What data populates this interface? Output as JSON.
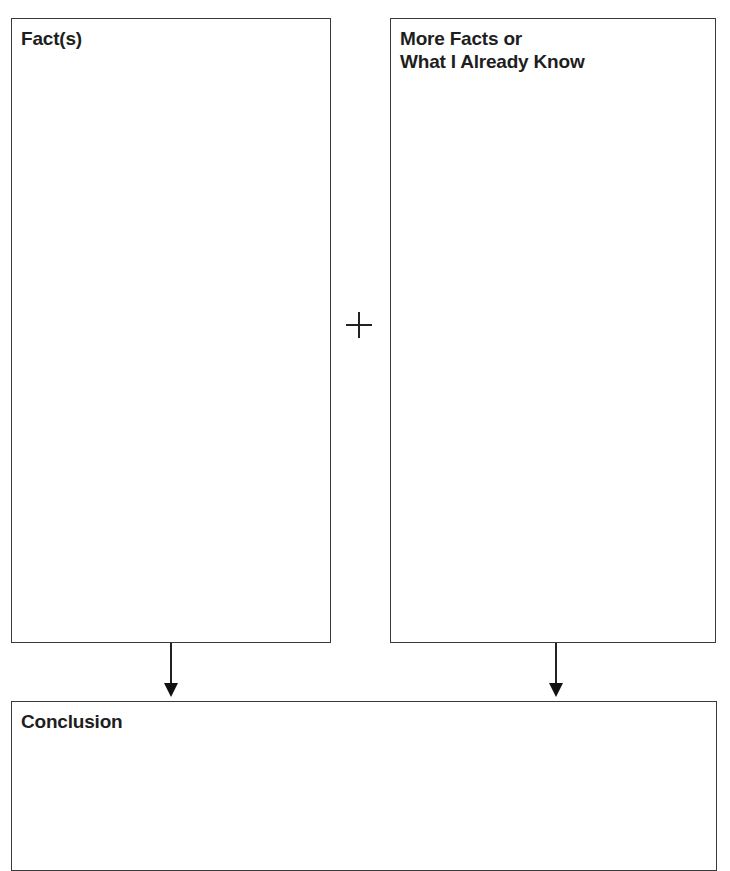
{
  "organizer": {
    "fact_box": {
      "title": "Fact(s)"
    },
    "more_facts_box": {
      "title_line1": "More Facts or",
      "title_line2": "What I Already Know"
    },
    "operator": {
      "symbol": "plus-icon"
    },
    "conclusion_box": {
      "title": "Conclusion"
    }
  },
  "colors": {
    "border": "#3a3a3a",
    "text": "#1e1e1e",
    "background": "#ffffff"
  }
}
